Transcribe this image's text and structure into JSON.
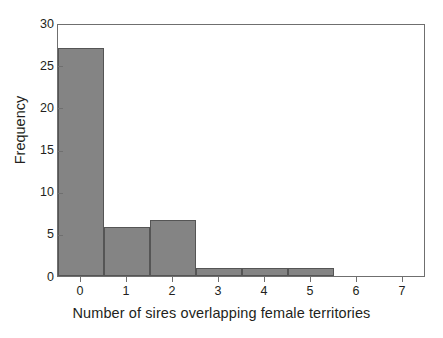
{
  "chart_data": {
    "type": "bar",
    "title": "",
    "subtitle": "",
    "xlabel": "Number of sires overlapping female territories",
    "ylabel": "Frequency",
    "categories": [
      "0",
      "1",
      "2",
      "3",
      "4",
      "5",
      "6",
      "7"
    ],
    "values": [
      27,
      5.8,
      6.7,
      1,
      1,
      1,
      0,
      0
    ],
    "series": [
      {
        "name": "Frequency",
        "values": [
          27,
          5.8,
          6.7,
          1,
          1,
          1,
          0,
          0
        ]
      }
    ],
    "xlim": [
      -0.5,
      7.5
    ],
    "ylim": [
      0,
      30
    ],
    "ytick_labels": [
      "0",
      "5",
      "10",
      "15",
      "20",
      "25",
      "30"
    ],
    "ytick_values": [
      0,
      5,
      10,
      15,
      20,
      25,
      30
    ],
    "xtick_labels": [
      "0",
      "1",
      "2",
      "3",
      "4",
      "5",
      "6",
      "7"
    ],
    "xtick_values": [
      0,
      1,
      2,
      3,
      4,
      5,
      6,
      7
    ],
    "grid": false,
    "legend": false,
    "legend_position": "none",
    "bar_color": "#848484",
    "bar_edge_color": "#555555",
    "axis_color": "#6f6f6f",
    "text_color": "#231f20",
    "background_color": "#ffffff",
    "bar_width": 1
  }
}
